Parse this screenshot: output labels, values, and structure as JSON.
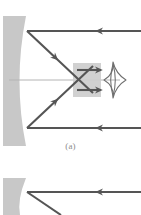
{
  "figure": {
    "background_color": "#ffffff",
    "panels": [
      {
        "id": "a",
        "caption": "(a)",
        "caption_color": "#8d8d8d",
        "description": "Concave mirror with two parallel incoming rays reflecting to a focal point, then diverging to an eye"
      },
      {
        "id": "b",
        "caption": "",
        "description": "Second panel, cropped at bottom edge of image"
      }
    ]
  },
  "colors": {
    "mirror_fill": "#c8c8c8",
    "ray_stroke": "#555555",
    "axis_stroke": "#b4b4b4",
    "highlight_fill": "#cfcfcf",
    "eye_stroke": "#6e6e6e",
    "caption_text": "#8d8d8d",
    "page_background": "#ffffff"
  },
  "panel_a": {
    "mirror": {
      "name": "concave-mirror",
      "fill": "#c8c8c8",
      "left_x": 3,
      "top_y": 16,
      "bottom_y": 146,
      "surface_vertex_x": 33,
      "edge_x": 24
    },
    "optical_axis": {
      "name": "optical-axis",
      "y": 80,
      "x_start": 8,
      "x_end": 120,
      "stroke": "#b4b4b4",
      "width": 1
    },
    "incoming_rays": [
      {
        "name": "incoming-ray-upper",
        "y": 31,
        "x_start": 141,
        "x_end": 27,
        "direction": "leftward",
        "arrow_at_x": 95
      },
      {
        "name": "incoming-ray-lower",
        "y": 128,
        "x_start": 141,
        "x_end": 27,
        "direction": "leftward",
        "arrow_at_x": 95
      }
    ],
    "reflected_rays": [
      {
        "name": "reflected-ray-upper",
        "from_x": 27,
        "from_y": 31,
        "to_x": 92,
        "to_y": 92,
        "direction": "down-right",
        "arrow_t": 0.42
      },
      {
        "name": "reflected-ray-lower",
        "from_x": 27,
        "from_y": 128,
        "to_x": 92,
        "to_y": 67,
        "direction": "up-right",
        "arrow_t": 0.42
      }
    ],
    "focal_point": {
      "name": "focal-point",
      "x": 78,
      "y": 80
    },
    "diverging_rays": [
      {
        "name": "diverging-ray-upper",
        "from_x": 78,
        "from_y": 70,
        "to_x": 105,
        "to_y": 70,
        "direction": "rightward"
      },
      {
        "name": "diverging-ray-lower",
        "from_x": 78,
        "from_y": 90,
        "to_x": 105,
        "to_y": 90,
        "direction": "rightward"
      }
    ],
    "highlight_band": {
      "name": "ray-bundle-highlight",
      "x": 73,
      "y": 63,
      "width": 28,
      "height": 34,
      "fill": "#cfcfcf"
    },
    "eye": {
      "name": "observer-eye",
      "center_x": 115,
      "center_y": 80,
      "half_width": 11,
      "half_height": 18,
      "pupil_half_width": 4,
      "stroke": "#6e6e6e"
    }
  },
  "panel_b": {
    "mirror": {
      "name": "concave-mirror",
      "fill": "#c8c8c8",
      "left_x": 3,
      "top_y": 178,
      "bottom_y": 215,
      "surface_vertex_x": 33,
      "edge_x": 24
    },
    "incoming_rays": [
      {
        "name": "incoming-ray-upper",
        "y": 192,
        "x_start": 141,
        "x_end": 27,
        "direction": "leftward",
        "arrow_at_x": 95
      }
    ],
    "reflected_rays": [
      {
        "name": "reflected-ray-upper",
        "from_x": 27,
        "from_y": 192,
        "to_x": 60,
        "to_y": 215,
        "direction": "down-right"
      }
    ]
  }
}
